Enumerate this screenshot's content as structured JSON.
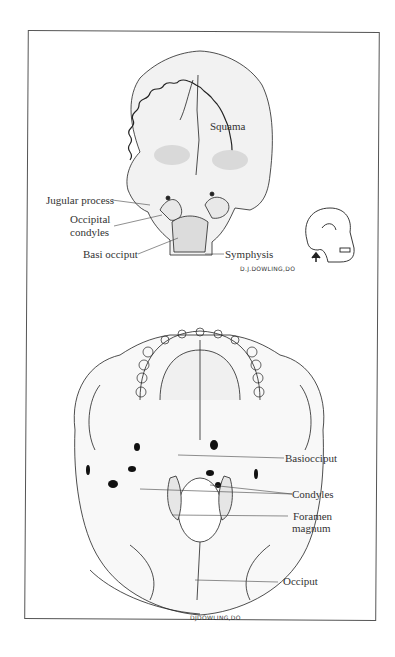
{
  "figure": {
    "top_view": {
      "title": "Occipital bone (posterior view)",
      "labels": {
        "squama": "Squama",
        "jugular_process": "Jugular process",
        "occipital_condyles_line1": "Occipital",
        "occipital_condyles_line2": "condyles",
        "basi_occiput": "Basi occiput",
        "symphysis": "Symphysis"
      },
      "signature": "D.J.DOWLING,DO",
      "orientation_icon": "skull-lateral-with-up-arrow"
    },
    "bottom_view": {
      "title": "Skull (inferior view)",
      "labels": {
        "basiocciput": "Basiocciput",
        "condyles": "Condyles",
        "foramen_line1": "Foramen",
        "foramen_line2": "magnum",
        "occiput": "Occiput"
      },
      "signature": "DJDOWLING,DO"
    },
    "colors": {
      "line": "#222222",
      "shade": "#d9d9d9",
      "label_text": "#333333",
      "frame": "#555555"
    }
  }
}
